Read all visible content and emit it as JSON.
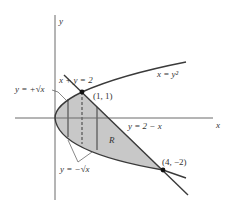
{
  "figure": {
    "axes": {
      "x_label": "x",
      "y_label": "y"
    },
    "curves": {
      "parabola": "x = y²",
      "line_top": "x + y = 2",
      "line_bottom": "y = 2 − x",
      "upper_branch": "y = +√x",
      "lower_branch": "y = −√x"
    },
    "points": {
      "p1": "(1, 1)",
      "p2": "(4, −2)"
    },
    "region_label": "R"
  },
  "colors": {
    "shade": "#c8c8c8",
    "stroke": "#3a3a3a",
    "axis": "#6a6a6a",
    "background": "#ffffff"
  }
}
